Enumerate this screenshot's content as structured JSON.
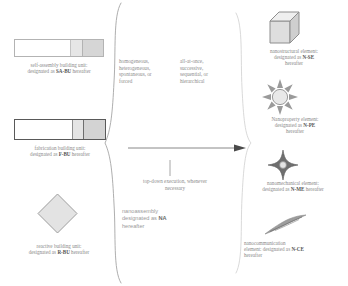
{
  "diagram": {
    "accent_color": "#555555",
    "line_color": "#8a8a8a",
    "fill_light": "#e6e6e6",
    "fill_mid": "#d6d6d6"
  },
  "inputs": [
    {
      "id": "sa-bu",
      "shape_icon": "segmented-bar-thin-icon",
      "line1": "self-assembly building unit:",
      "line2_prefix": "designated as ",
      "line2_code": "SA-BU",
      "line2_suffix": " hereafter"
    },
    {
      "id": "f-bu",
      "shape_icon": "segmented-bar-bold-icon",
      "line1": "fabrication building unit:",
      "line2_prefix": "designated as ",
      "line2_code": "F-BU",
      "line2_suffix": " hereafter"
    },
    {
      "id": "r-bu",
      "shape_icon": "diamond-icon",
      "line1": "reactive building unit:",
      "line2_prefix": "designated as ",
      "line2_code": "R-BU",
      "line2_suffix": " hereafter"
    }
  ],
  "modifiers": {
    "column1": "homogeneous, heterogeneous, spontaneous, or forced",
    "column2": "all-at-once, successive, sequential, or hierarchical",
    "column3": "top-down execution, whenever necessary"
  },
  "process": {
    "line1": "nanoassembly",
    "line2_prefix": "designated as ",
    "line2_code": "NA",
    "line3": "hereafter"
  },
  "outputs": [
    {
      "id": "n-se",
      "shape_icon": "cube-3d-icon",
      "line1": "nanostructural element:",
      "line2_prefix": "designated as ",
      "line2_code": "N-SE",
      "line2_suffix": "",
      "line3": "hereafter"
    },
    {
      "id": "n-pe",
      "shape_icon": "starburst-sun-icon",
      "line1": "Nanoproperty element:",
      "line2_prefix": "designated as ",
      "line2_code": "N-PE",
      "line2_suffix": "",
      "line3": "hereafter"
    },
    {
      "id": "n-me",
      "shape_icon": "four-point-star-icon",
      "line1": "nanomechanical element:",
      "line2_prefix": "designated as ",
      "line2_code": "N-ME",
      "line2_suffix": " hereafter",
      "line3": ""
    },
    {
      "id": "n-ce",
      "shape_icon": "wave-feather-icon",
      "line1": "nanocommunication",
      "line2_prefix": "element: designated as ",
      "line2_code": "N-CE",
      "line2_suffix": "",
      "line3": "hereafter"
    }
  ]
}
